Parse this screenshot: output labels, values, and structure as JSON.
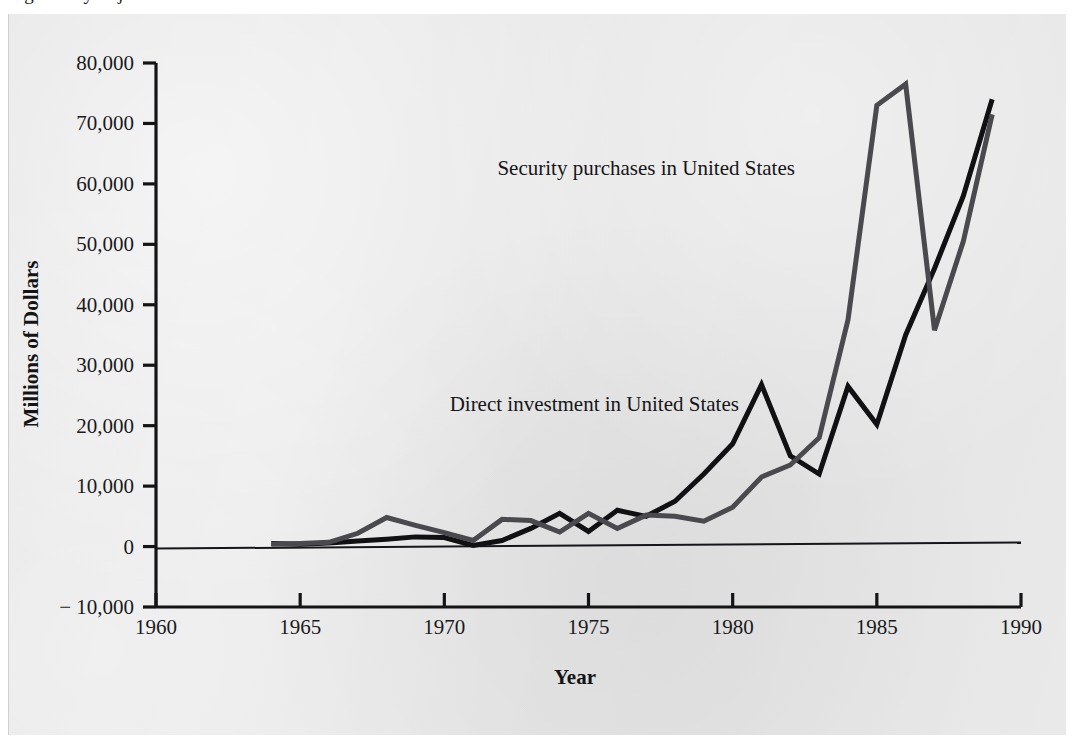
{
  "figure": {
    "caption_partial": "Figure  ...  y  ...  j  ...",
    "background_color": "#e9e9e9",
    "page_color": "#ffffff"
  },
  "chart_data": {
    "type": "line",
    "title": "",
    "xlabel": "Year",
    "ylabel": "Millions of Dollars",
    "xlim": [
      1960,
      1990
    ],
    "ylim": [
      -10000,
      80000
    ],
    "xticks": [
      1960,
      1965,
      1970,
      1975,
      1980,
      1985,
      1990
    ],
    "xtick_labels": [
      "1960",
      "1965",
      "1970",
      "1975",
      "1980",
      "1985",
      "1990"
    ],
    "yticks": [
      -10000,
      0,
      10000,
      20000,
      30000,
      40000,
      50000,
      60000,
      70000,
      80000
    ],
    "ytick_labels": [
      "− 10,000",
      "0",
      "10,000",
      "20,000",
      "30,000",
      "40,000",
      "50,000",
      "60,000",
      "70,000",
      "80,000"
    ],
    "grid": false,
    "legend": "inline-annotations",
    "x": [
      1964,
      1965,
      1966,
      1967,
      1968,
      1969,
      1970,
      1971,
      1972,
      1973,
      1974,
      1975,
      1976,
      1977,
      1978,
      1979,
      1980,
      1981,
      1982,
      1983,
      1984,
      1985,
      1986,
      1987,
      1988,
      1989
    ],
    "series": [
      {
        "name": "Direct investment in United States",
        "color": "#111114",
        "line_width": 5,
        "label_x": 1975.2,
        "label_y": 22500,
        "values": [
          500,
          400,
          600,
          900,
          1200,
          1600,
          1500,
          200,
          1000,
          3000,
          5500,
          2500,
          6000,
          5000,
          7500,
          12000,
          17000,
          26800,
          15000,
          12000,
          26500,
          20200,
          35000,
          46000,
          58000,
          74000
        ]
      },
      {
        "name": "Security purchases in United States",
        "color": "#4a4a4e",
        "line_width": 5,
        "label_x": 1977.0,
        "label_y": 61500,
        "values": [
          400,
          500,
          700,
          2200,
          4800,
          3500,
          2300,
          1000,
          4500,
          4300,
          2400,
          5500,
          3000,
          5200,
          5000,
          4200,
          6500,
          11500,
          13500,
          18000,
          37500,
          73000,
          76500,
          35800,
          50500,
          71500
        ]
      }
    ],
    "baseline_note": "zero reference line drawn across plot",
    "data_start_year": 1964,
    "data_end_year": 1989
  },
  "axes": {
    "y_axis_title": "Millions of Dollars",
    "x_axis_title": "Year"
  }
}
